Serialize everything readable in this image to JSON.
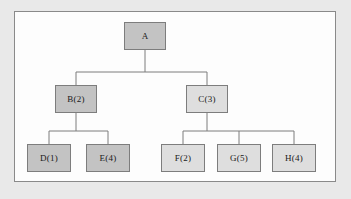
{
  "diagram": {
    "frame": {
      "border_color": "#8a8a8a",
      "fill": "#fdfdfd"
    },
    "page_background": "#e9e9e9",
    "edge_color": "#7d7d7d",
    "colors": {
      "dark_node": "#c3c3c3",
      "light_node": "#dedede",
      "node_border": "#7d7d7d",
      "text": "#191919"
    },
    "nodes": [
      {
        "id": "A",
        "label": "A",
        "shade": "dark",
        "x": 124,
        "y": 22,
        "w": 42,
        "h": 28,
        "level": 0
      },
      {
        "id": "B",
        "label": "B(2)",
        "shade": "dark",
        "x": 55,
        "y": 85,
        "w": 42,
        "h": 28,
        "level": 1
      },
      {
        "id": "C",
        "label": "C(3)",
        "shade": "light",
        "x": 186,
        "y": 85,
        "w": 42,
        "h": 28,
        "level": 1
      },
      {
        "id": "D",
        "label": "D(1)",
        "shade": "dark",
        "x": 27,
        "y": 144,
        "w": 44,
        "h": 28,
        "level": 2
      },
      {
        "id": "E",
        "label": "E(4)",
        "shade": "dark",
        "x": 86,
        "y": 144,
        "w": 44,
        "h": 28,
        "level": 2
      },
      {
        "id": "F",
        "label": "F(2)",
        "shade": "light",
        "x": 161,
        "y": 144,
        "w": 44,
        "h": 28,
        "level": 2
      },
      {
        "id": "G",
        "label": "G(5)",
        "shade": "light",
        "x": 217,
        "y": 144,
        "w": 44,
        "h": 28,
        "level": 2
      },
      {
        "id": "H",
        "label": "H(4)",
        "shade": "light",
        "x": 272,
        "y": 144,
        "w": 44,
        "h": 28,
        "level": 2
      }
    ],
    "edges": [
      {
        "from": "A",
        "to": "B"
      },
      {
        "from": "A",
        "to": "C"
      },
      {
        "from": "B",
        "to": "D"
      },
      {
        "from": "B",
        "to": "E"
      },
      {
        "from": "C",
        "to": "F"
      },
      {
        "from": "C",
        "to": "G"
      },
      {
        "from": "C",
        "to": "H"
      }
    ]
  }
}
